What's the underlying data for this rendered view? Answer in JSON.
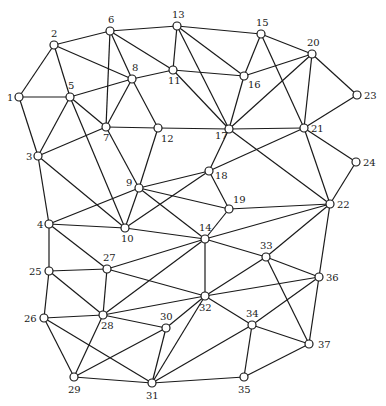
{
  "diagram": {
    "type": "undirected-graph",
    "nodes": [
      {
        "id": "1",
        "label": "1"
      },
      {
        "id": "2",
        "label": "2"
      },
      {
        "id": "3",
        "label": "3"
      },
      {
        "id": "4",
        "label": "4"
      },
      {
        "id": "5",
        "label": "5"
      },
      {
        "id": "6",
        "label": "6"
      },
      {
        "id": "7",
        "label": "7"
      },
      {
        "id": "8",
        "label": "8"
      },
      {
        "id": "9",
        "label": "9"
      },
      {
        "id": "10",
        "label": "10"
      },
      {
        "id": "11",
        "label": "11"
      },
      {
        "id": "12",
        "label": "12"
      },
      {
        "id": "13",
        "label": "13"
      },
      {
        "id": "14",
        "label": "14"
      },
      {
        "id": "15",
        "label": "15"
      },
      {
        "id": "16",
        "label": "16"
      },
      {
        "id": "17",
        "label": "17"
      },
      {
        "id": "18",
        "label": "18"
      },
      {
        "id": "19",
        "label": "19"
      },
      {
        "id": "20",
        "label": "20"
      },
      {
        "id": "21",
        "label": "21"
      },
      {
        "id": "22",
        "label": "22"
      },
      {
        "id": "23",
        "label": "23"
      },
      {
        "id": "24",
        "label": "24"
      },
      {
        "id": "25",
        "label": "25"
      },
      {
        "id": "26",
        "label": "26"
      },
      {
        "id": "27",
        "label": "27"
      },
      {
        "id": "28",
        "label": "28"
      },
      {
        "id": "29",
        "label": "29"
      },
      {
        "id": "30",
        "label": "30"
      },
      {
        "id": "31",
        "label": "31"
      },
      {
        "id": "32",
        "label": "32"
      },
      {
        "id": "33",
        "label": "33"
      },
      {
        "id": "34",
        "label": "34"
      },
      {
        "id": "35",
        "label": "35"
      },
      {
        "id": "36",
        "label": "36"
      },
      {
        "id": "37",
        "label": "37"
      }
    ],
    "edges": [
      [
        "1",
        "2"
      ],
      [
        "1",
        "5"
      ],
      [
        "1",
        "3"
      ],
      [
        "2",
        "6"
      ],
      [
        "2",
        "5"
      ],
      [
        "2",
        "8"
      ],
      [
        "3",
        "5"
      ],
      [
        "3",
        "7"
      ],
      [
        "3",
        "4"
      ],
      [
        "3",
        "10"
      ],
      [
        "4",
        "9"
      ],
      [
        "4",
        "10"
      ],
      [
        "4",
        "25"
      ],
      [
        "4",
        "27"
      ],
      [
        "5",
        "8"
      ],
      [
        "5",
        "7"
      ],
      [
        "5",
        "10"
      ],
      [
        "6",
        "13"
      ],
      [
        "6",
        "8"
      ],
      [
        "6",
        "7"
      ],
      [
        "6",
        "11"
      ],
      [
        "7",
        "8"
      ],
      [
        "7",
        "12"
      ],
      [
        "7",
        "9"
      ],
      [
        "8",
        "11"
      ],
      [
        "8",
        "12"
      ],
      [
        "9",
        "12"
      ],
      [
        "9",
        "10"
      ],
      [
        "9",
        "18"
      ],
      [
        "9",
        "19"
      ],
      [
        "9",
        "14"
      ],
      [
        "10",
        "18"
      ],
      [
        "10",
        "14"
      ],
      [
        "11",
        "13"
      ],
      [
        "11",
        "16"
      ],
      [
        "11",
        "17"
      ],
      [
        "12",
        "17"
      ],
      [
        "13",
        "15"
      ],
      [
        "13",
        "16"
      ],
      [
        "13",
        "17"
      ],
      [
        "14",
        "19"
      ],
      [
        "14",
        "22"
      ],
      [
        "14",
        "33"
      ],
      [
        "14",
        "32"
      ],
      [
        "14",
        "27"
      ],
      [
        "14",
        "28"
      ],
      [
        "15",
        "16"
      ],
      [
        "15",
        "20"
      ],
      [
        "15",
        "21"
      ],
      [
        "16",
        "20"
      ],
      [
        "16",
        "17"
      ],
      [
        "17",
        "20"
      ],
      [
        "17",
        "21"
      ],
      [
        "17",
        "18"
      ],
      [
        "17",
        "22"
      ],
      [
        "18",
        "19"
      ],
      [
        "18",
        "21"
      ],
      [
        "19",
        "22"
      ],
      [
        "20",
        "21"
      ],
      [
        "20",
        "23"
      ],
      [
        "21",
        "23"
      ],
      [
        "21",
        "24"
      ],
      [
        "21",
        "22"
      ],
      [
        "22",
        "24"
      ],
      [
        "22",
        "33"
      ],
      [
        "22",
        "36"
      ],
      [
        "25",
        "27"
      ],
      [
        "25",
        "26"
      ],
      [
        "25",
        "28"
      ],
      [
        "26",
        "28"
      ],
      [
        "26",
        "29"
      ],
      [
        "26",
        "31"
      ],
      [
        "27",
        "28"
      ],
      [
        "27",
        "32"
      ],
      [
        "28",
        "32"
      ],
      [
        "28",
        "30"
      ],
      [
        "28",
        "29"
      ],
      [
        "29",
        "30"
      ],
      [
        "29",
        "31"
      ],
      [
        "30",
        "31"
      ],
      [
        "30",
        "32"
      ],
      [
        "31",
        "32"
      ],
      [
        "31",
        "34"
      ],
      [
        "31",
        "35"
      ],
      [
        "32",
        "33"
      ],
      [
        "32",
        "36"
      ],
      [
        "32",
        "34"
      ],
      [
        "33",
        "36"
      ],
      [
        "33",
        "37"
      ],
      [
        "34",
        "36"
      ],
      [
        "34",
        "37"
      ],
      [
        "34",
        "35"
      ],
      [
        "35",
        "37"
      ],
      [
        "36",
        "37"
      ]
    ]
  }
}
